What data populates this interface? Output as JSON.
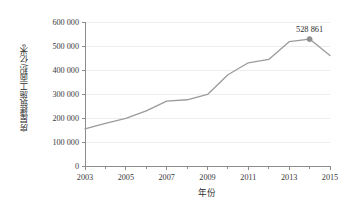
{
  "chart_data": {
    "type": "line",
    "title": "",
    "xlabel": "年份",
    "ylabel": "房屋建筑施工面积/亿米³",
    "x": [
      2003,
      2004,
      2005,
      2006,
      2007,
      2008,
      2009,
      2010,
      2011,
      2012,
      2013,
      2014,
      2015
    ],
    "values": [
      155000,
      178000,
      198000,
      230000,
      270000,
      276000,
      298000,
      380000,
      430000,
      444000,
      518000,
      528861,
      460000
    ],
    "categories": [
      "2003",
      "2004",
      "2005",
      "2006",
      "2007",
      "2008",
      "2009",
      "2010",
      "2011",
      "2012",
      "2013",
      "2014",
      "2015"
    ],
    "xlim": [
      2003,
      2015
    ],
    "ylim": [
      0,
      600000
    ],
    "xticks": [
      2003,
      2005,
      2007,
      2009,
      2011,
      2013,
      2015
    ],
    "xtick_labels": [
      "2003",
      "2005",
      "2007",
      "2009",
      "2011",
      "2013",
      "2015"
    ],
    "yticks": [
      0,
      100000,
      200000,
      300000,
      400000,
      500000,
      600000
    ],
    "ytick_labels": [
      "0",
      "100 000",
      "200 000",
      "300 000",
      "400 000",
      "500 000",
      "600 000"
    ],
    "grid": true,
    "legend": false,
    "legend_position": "none",
    "series_color": "#9b9b9b",
    "grid_color": "#ededed",
    "axis_color": "#8c8c8c",
    "annotations": [
      {
        "text": "528 861",
        "x": 2014,
        "y": 528861,
        "marker": true,
        "marker_color": "#8f8f8f"
      }
    ]
  }
}
